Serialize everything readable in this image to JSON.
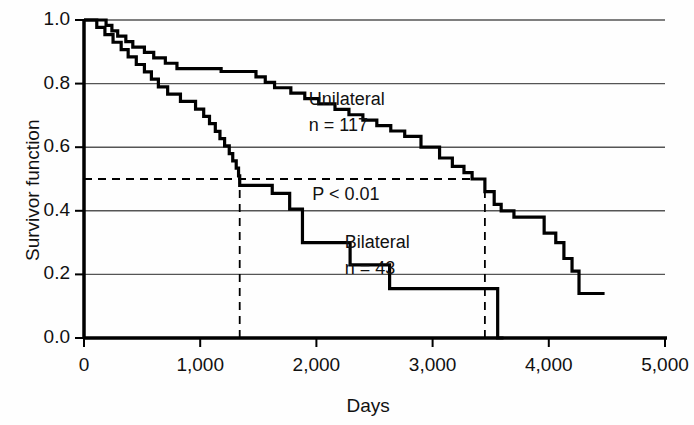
{
  "chart_data": {
    "type": "line",
    "title": "",
    "subtitle": "",
    "xlabel": "Days",
    "ylabel": "Survivor function",
    "xlim": [
      0,
      5000
    ],
    "ylim": [
      0.0,
      1.0
    ],
    "xticks": [
      0,
      1000,
      2000,
      3000,
      4000,
      5000
    ],
    "xtick_labels": [
      "0",
      "1,000",
      "2,000",
      "3,000",
      "4,000",
      "5,000"
    ],
    "yticks": [
      0.0,
      0.2,
      0.4,
      0.6,
      0.8,
      1.0
    ],
    "ytick_labels": [
      "0.0",
      "0.2",
      "0.4",
      "0.6",
      "0.8",
      "1.0"
    ],
    "grid": true,
    "grid_axis": "y",
    "grid_values": [
      0.2,
      0.4,
      0.6,
      0.8,
      1.0
    ],
    "legend_position": "inline-annotation",
    "line_color": "#000000",
    "grid_color": "#555555",
    "axis_color": "#000000",
    "annotations": [
      {
        "name": "unilateral-label",
        "text": "Unilateral",
        "x": 2330,
        "y": 0.745
      },
      {
        "name": "unilateral-n",
        "text": "n = 117",
        "x": 2330,
        "y": 0.665
      },
      {
        "name": "pvalue",
        "text": "P < 0.01",
        "x": 2360,
        "y": 0.445
      },
      {
        "name": "bilateral-label",
        "text": "Bilateral",
        "x": 2640,
        "y": 0.295
      },
      {
        "name": "bilateral-n",
        "text": "n = 43",
        "x": 2640,
        "y": 0.215
      }
    ],
    "reference_lines": [
      {
        "name": "median-survival-horizontal",
        "orientation": "horizontal",
        "value": 0.5,
        "style": "dashed",
        "x_from": 0,
        "x_to": 3450
      },
      {
        "name": "median-bilateral-vertical",
        "orientation": "vertical",
        "value": 1340,
        "style": "dashed",
        "y_from": 0.0,
        "y_to": 0.5
      },
      {
        "name": "median-unilateral-vertical",
        "orientation": "vertical",
        "value": 3450,
        "style": "dashed",
        "y_from": 0.0,
        "y_to": 0.5
      }
    ],
    "series": [
      {
        "name": "Unilateral",
        "n": 117,
        "median_survival_days": 3450,
        "step": "post",
        "points": [
          [
            0,
            1.0
          ],
          [
            190,
            1.0
          ],
          [
            190,
            0.983
          ],
          [
            240,
            0.983
          ],
          [
            240,
            0.966
          ],
          [
            290,
            0.966
          ],
          [
            290,
            0.949
          ],
          [
            360,
            0.949
          ],
          [
            360,
            0.932
          ],
          [
            420,
            0.932
          ],
          [
            420,
            0.915
          ],
          [
            520,
            0.915
          ],
          [
            520,
            0.898
          ],
          [
            600,
            0.898
          ],
          [
            600,
            0.881
          ],
          [
            700,
            0.881
          ],
          [
            700,
            0.864
          ],
          [
            800,
            0.864
          ],
          [
            800,
            0.847
          ],
          [
            1180,
            0.847
          ],
          [
            1180,
            0.838
          ],
          [
            1480,
            0.838
          ],
          [
            1480,
            0.821
          ],
          [
            1560,
            0.821
          ],
          [
            1560,
            0.804
          ],
          [
            1640,
            0.804
          ],
          [
            1640,
            0.787
          ],
          [
            1780,
            0.787
          ],
          [
            1780,
            0.77
          ],
          [
            1900,
            0.77
          ],
          [
            1900,
            0.753
          ],
          [
            2020,
            0.753
          ],
          [
            2020,
            0.736
          ],
          [
            2160,
            0.736
          ],
          [
            2160,
            0.719
          ],
          [
            2280,
            0.719
          ],
          [
            2280,
            0.702
          ],
          [
            2400,
            0.702
          ],
          [
            2400,
            0.685
          ],
          [
            2520,
            0.685
          ],
          [
            2520,
            0.668
          ],
          [
            2640,
            0.668
          ],
          [
            2640,
            0.651
          ],
          [
            2760,
            0.651
          ],
          [
            2760,
            0.634
          ],
          [
            2900,
            0.634
          ],
          [
            2900,
            0.6
          ],
          [
            3060,
            0.6
          ],
          [
            3060,
            0.566
          ],
          [
            3170,
            0.566
          ],
          [
            3170,
            0.54
          ],
          [
            3270,
            0.54
          ],
          [
            3270,
            0.52
          ],
          [
            3340,
            0.52
          ],
          [
            3340,
            0.5
          ],
          [
            3450,
            0.5
          ],
          [
            3450,
            0.46
          ],
          [
            3530,
            0.46
          ],
          [
            3530,
            0.42
          ],
          [
            3590,
            0.42
          ],
          [
            3590,
            0.4
          ],
          [
            3700,
            0.4
          ],
          [
            3700,
            0.38
          ],
          [
            3960,
            0.38
          ],
          [
            3960,
            0.33
          ],
          [
            4060,
            0.33
          ],
          [
            4060,
            0.3
          ],
          [
            4130,
            0.3
          ],
          [
            4130,
            0.25
          ],
          [
            4200,
            0.25
          ],
          [
            4200,
            0.21
          ],
          [
            4260,
            0.21
          ],
          [
            4260,
            0.14
          ],
          [
            4480,
            0.14
          ]
        ]
      },
      {
        "name": "Bilateral",
        "n": 43,
        "median_survival_days": 1340,
        "step": "post",
        "points": [
          [
            0,
            1.0
          ],
          [
            110,
            1.0
          ],
          [
            110,
            0.977
          ],
          [
            180,
            0.977
          ],
          [
            180,
            0.954
          ],
          [
            250,
            0.954
          ],
          [
            250,
            0.93
          ],
          [
            320,
            0.93
          ],
          [
            320,
            0.907
          ],
          [
            380,
            0.907
          ],
          [
            380,
            0.884
          ],
          [
            450,
            0.884
          ],
          [
            450,
            0.86
          ],
          [
            520,
            0.86
          ],
          [
            520,
            0.837
          ],
          [
            580,
            0.837
          ],
          [
            580,
            0.814
          ],
          [
            640,
            0.814
          ],
          [
            640,
            0.79
          ],
          [
            720,
            0.79
          ],
          [
            720,
            0.767
          ],
          [
            830,
            0.767
          ],
          [
            830,
            0.744
          ],
          [
            960,
            0.744
          ],
          [
            960,
            0.72
          ],
          [
            1030,
            0.72
          ],
          [
            1030,
            0.697
          ],
          [
            1080,
            0.697
          ],
          [
            1080,
            0.674
          ],
          [
            1130,
            0.674
          ],
          [
            1130,
            0.65
          ],
          [
            1170,
            0.65
          ],
          [
            1170,
            0.627
          ],
          [
            1210,
            0.627
          ],
          [
            1210,
            0.604
          ],
          [
            1250,
            0.604
          ],
          [
            1250,
            0.58
          ],
          [
            1280,
            0.58
          ],
          [
            1280,
            0.557
          ],
          [
            1310,
            0.557
          ],
          [
            1310,
            0.534
          ],
          [
            1330,
            0.534
          ],
          [
            1330,
            0.51
          ],
          [
            1340,
            0.51
          ],
          [
            1340,
            0.48
          ],
          [
            1620,
            0.48
          ],
          [
            1620,
            0.455
          ],
          [
            1770,
            0.455
          ],
          [
            1770,
            0.405
          ],
          [
            1880,
            0.405
          ],
          [
            1880,
            0.3
          ],
          [
            2290,
            0.3
          ],
          [
            2290,
            0.23
          ],
          [
            2630,
            0.23
          ],
          [
            2630,
            0.155
          ],
          [
            3560,
            0.155
          ],
          [
            3560,
            0.0
          ],
          [
            3610,
            0.0
          ]
        ]
      }
    ]
  },
  "figure": {
    "background": "#ffffff"
  }
}
